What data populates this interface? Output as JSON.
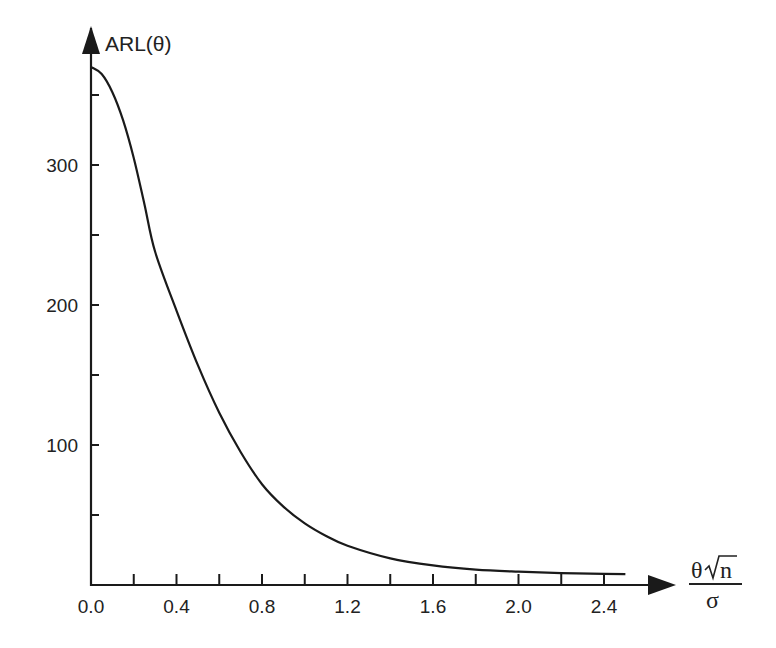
{
  "chart_data": {
    "type": "line",
    "title": "",
    "ylabel": "ARL(θ)",
    "xlabel": "θ√n / σ",
    "xlabel_parts": {
      "numerator_theta": "θ",
      "numerator_n": "n",
      "denominator": "σ"
    },
    "xlim": [
      0.0,
      2.5
    ],
    "ylim": [
      0,
      370
    ],
    "x_ticks": [
      0.0,
      0.2,
      0.4,
      0.6,
      0.8,
      1.0,
      1.2,
      1.4,
      1.6,
      1.8,
      2.0,
      2.2,
      2.4
    ],
    "x_tick_labels": [
      "0.0",
      "0.4",
      "0.8",
      "1.2",
      "1.6",
      "2.0",
      "2.4"
    ],
    "y_ticks": [
      50,
      100,
      150,
      200,
      250,
      300,
      350
    ],
    "y_tick_labels": [
      "100",
      "200",
      "300"
    ],
    "grid": false,
    "legend": null,
    "series": [
      {
        "name": "ARL(θ)",
        "x": [
          0.0,
          0.05,
          0.1,
          0.15,
          0.2,
          0.25,
          0.3,
          0.4,
          0.5,
          0.6,
          0.7,
          0.8,
          0.9,
          1.0,
          1.1,
          1.2,
          1.4,
          1.6,
          1.8,
          2.0,
          2.2,
          2.4,
          2.5
        ],
        "values": [
          370,
          365,
          352,
          332,
          305,
          272,
          238,
          196,
          157,
          123,
          95,
          72,
          56,
          44,
          35,
          28,
          19,
          14,
          11,
          9.5,
          8.5,
          8,
          7.8
        ]
      }
    ]
  }
}
